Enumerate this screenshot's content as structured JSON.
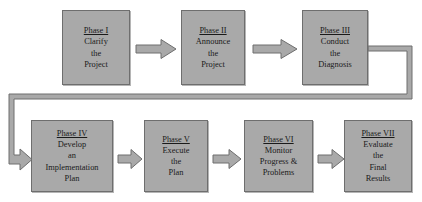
{
  "diagram": {
    "colors": {
      "box_fill": "#a9a9a9",
      "box_border": "#6e6e6e",
      "arrow_fill": "#a9a9a9",
      "arrow_border": "#6e6e6e",
      "background": "#ffffff",
      "text": "#1a1a1a"
    },
    "phases": [
      {
        "id": "phase-1",
        "title": "Phase I",
        "lines": [
          "Clarify",
          "the",
          "Project"
        ]
      },
      {
        "id": "phase-2",
        "title": "Phase II",
        "lines": [
          "Announce",
          "the",
          "Project"
        ]
      },
      {
        "id": "phase-3",
        "title": "Phase III",
        "lines": [
          "Conduct",
          "the",
          "Diagnosis"
        ]
      },
      {
        "id": "phase-4",
        "title": "Phase IV",
        "lines": [
          "Develop",
          "an",
          "Implementation",
          "Plan"
        ]
      },
      {
        "id": "phase-5",
        "title": "Phase V",
        "lines": [
          "Execute",
          "the",
          "Plan"
        ]
      },
      {
        "id": "phase-6",
        "title": "Phase VI",
        "lines": [
          "Monitor",
          "Progress &",
          "Problems"
        ]
      },
      {
        "id": "phase-7",
        "title": "Phase VII",
        "lines": [
          "Evaluate",
          "the",
          "Final",
          "Results"
        ]
      }
    ],
    "connectors": [
      {
        "id": "arrow-1-to-2",
        "from": "Phase I",
        "to": "Phase II",
        "kind": "block-arrow-right"
      },
      {
        "id": "arrow-2-to-3",
        "from": "Phase II",
        "to": "Phase III",
        "kind": "block-arrow-right"
      },
      {
        "id": "elbow-3-to-4",
        "from": "Phase III",
        "to": "Phase IV",
        "kind": "elbow-wraparound"
      },
      {
        "id": "arrow-4-to-5",
        "from": "Phase IV",
        "to": "Phase V",
        "kind": "block-arrow-right"
      },
      {
        "id": "arrow-5-to-6",
        "from": "Phase V",
        "to": "Phase VI",
        "kind": "block-arrow-right"
      },
      {
        "id": "arrow-6-to-7",
        "from": "Phase VI",
        "to": "Phase VII",
        "kind": "block-arrow-right"
      }
    ]
  }
}
